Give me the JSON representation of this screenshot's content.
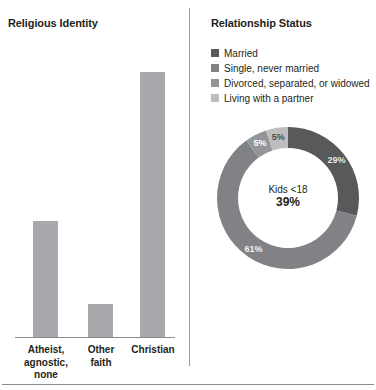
{
  "chart_data": [
    {
      "type": "bar",
      "title": "Religious Identity",
      "categories": [
        "Atheist, agnostic, none",
        "Other faith",
        "Christian"
      ],
      "category_lines": [
        [
          "Atheist,",
          "agnostic,",
          "none"
        ],
        [
          "Other",
          "faith"
        ],
        [
          "Christian"
        ]
      ],
      "values": [
        28,
        8,
        64
      ],
      "value_labels": [
        "28%",
        "8%",
        "64%"
      ],
      "xlabel": "",
      "ylabel": "",
      "ylim": [
        0,
        70
      ],
      "grid": false,
      "bar_color": "#a7a9ac",
      "axis_color": "#8c8c8c"
    },
    {
      "type": "pie",
      "title": "Relationship Status",
      "subtype": "donut",
      "center_label": "Kids <18",
      "center_value": "39%",
      "legend_position": "top",
      "categories": [
        "Married",
        "Single, never married",
        "Divorced, separated, or widowed",
        "Living with a partner"
      ],
      "values": [
        61,
        29,
        5,
        5
      ],
      "value_labels": [
        "61%",
        "29%",
        "5%",
        "5%"
      ],
      "colors": [
        "#808285",
        "#58595b",
        "#939598",
        "#bcbec0"
      ],
      "label_colors": [
        "#f2f2f2",
        "#e6e6e6",
        "#ffffff",
        "#4d4d4d"
      ]
    }
  ],
  "left_panel": {
    "title": "Religious Identity"
  },
  "right_panel": {
    "title": "Relationship Status",
    "legend": [
      {
        "label": "Married",
        "color": "#58595b"
      },
      {
        "label": "Single, never married",
        "color": "#808285"
      },
      {
        "label": "Divorced, separated, or widowed",
        "color": "#939598"
      },
      {
        "label": "Living with a partner",
        "color": "#bcbec0"
      }
    ],
    "donut": {
      "center_label": "Kids <18",
      "center_value": "39%"
    }
  }
}
